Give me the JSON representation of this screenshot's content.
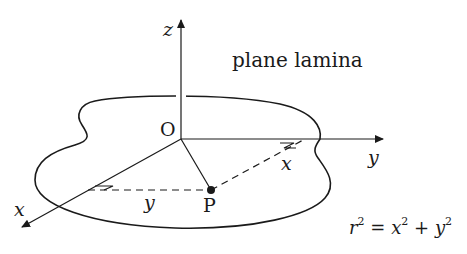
{
  "diagram": {
    "title": "plane lamina",
    "axes": {
      "z": {
        "label": "z"
      },
      "y": {
        "label": "y"
      },
      "x": {
        "label": "x"
      }
    },
    "origin": {
      "label": "O"
    },
    "point": {
      "label": "P"
    },
    "distances": {
      "x_distance": "x",
      "y_distance": "y"
    },
    "equation": {
      "lhs_var": "r",
      "lhs_exp": "2",
      "eq": "=",
      "t1_var": "x",
      "t1_exp": "2",
      "plus": "+",
      "t2_var": "y",
      "t2_exp": "2"
    },
    "colors": {
      "stroke": "#1a1a1a",
      "background": "#ffffff"
    }
  }
}
